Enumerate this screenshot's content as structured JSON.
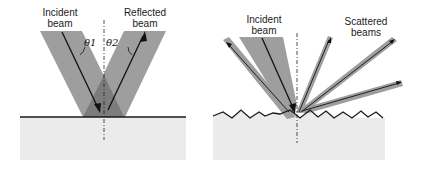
{
  "diagrams": {
    "specular": {
      "incident_label": "Incident beam",
      "incident_line1": "Incident",
      "incident_line2": "beam",
      "reflected_line1": "Reflected",
      "reflected_line2": "beam",
      "theta1": "θ1",
      "theta2": "θ2"
    },
    "diffuse": {
      "incident_line1": "Incident",
      "incident_line2": "beam",
      "scattered_line1": "Scattered",
      "scattered_line2": "beams"
    }
  },
  "colors": {
    "beam": "#9a9a9a",
    "beam_overlap": "#7f7f7f",
    "substrate": "#ebebeb",
    "surface_line": "#1a1a1a",
    "arrow": "#111111"
  }
}
